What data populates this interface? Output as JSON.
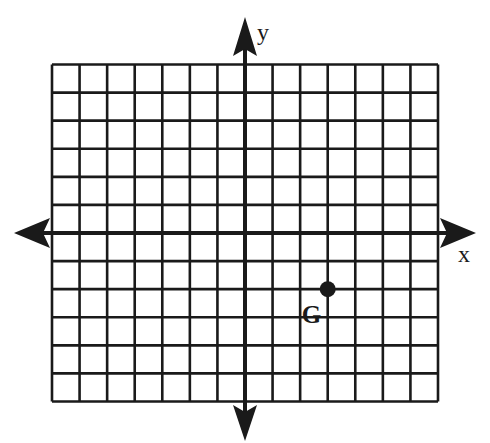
{
  "diagram": {
    "type": "coordinate-plane",
    "grid": {
      "columns": 14,
      "rows": 12,
      "x_min": -7,
      "x_max": 7,
      "y_min": -6,
      "y_max": 6,
      "cell_px": 27.9,
      "line_color": "#1a1a1a"
    },
    "axes": {
      "x_label": "x",
      "y_label": "y",
      "color": "#1a1a1a"
    },
    "points": [
      {
        "name": "G",
        "x": 3,
        "y": -2,
        "label": "G"
      }
    ]
  }
}
